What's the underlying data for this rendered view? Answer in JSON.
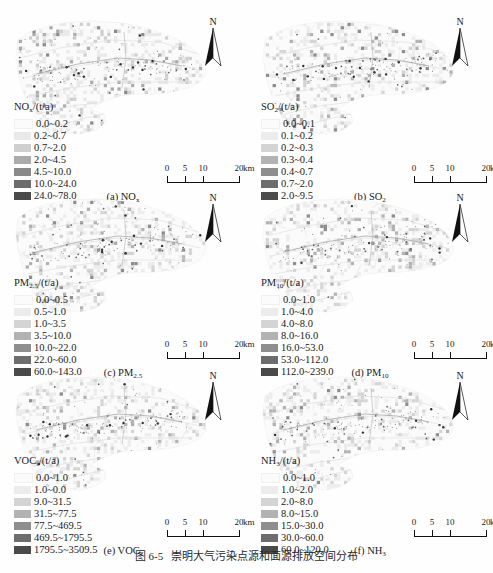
{
  "figure": {
    "caption_number": "图 6-5",
    "caption_text": "崇明大气污染点源和面源排放空间分布"
  },
  "common": {
    "north_label": "N",
    "scale": {
      "labels": [
        "0",
        "5",
        "10",
        "20"
      ],
      "unit": "km"
    }
  },
  "panels": [
    {
      "id": "a",
      "subcaption_prefix": "(a) NO",
      "subcaption_sub": "x",
      "legend_title_main": "NO",
      "legend_title_sub": "x",
      "legend_title_tail": "/(t/a)",
      "classes": [
        {
          "label": "0.0~0.2",
          "color": "#fbfbfb"
        },
        {
          "label": "0.2~0.7",
          "color": "#e9e9e9"
        },
        {
          "label": "0.7~2.0",
          "color": "#cfcfcf"
        },
        {
          "label": "2.0~4.5",
          "color": "#ababab"
        },
        {
          "label": "4.5~10.0",
          "color": "#8a8a8a"
        },
        {
          "label": "10.0~24.0",
          "color": "#6b6b6b"
        },
        {
          "label": "24.0~78.0",
          "color": "#4a4a4a"
        }
      ]
    },
    {
      "id": "b",
      "subcaption_prefix": "(b) SO",
      "subcaption_sub": "2",
      "legend_title_main": "SO",
      "legend_title_sub": "2",
      "legend_title_tail": "/(t/a)",
      "classes": [
        {
          "label": "0.0~0.1",
          "color": "#fbfbfb"
        },
        {
          "label": "0.1~0.2",
          "color": "#ececec"
        },
        {
          "label": "0.2~0.3",
          "color": "#d4d4d4"
        },
        {
          "label": "0.3~0.4",
          "color": "#b2b2b2"
        },
        {
          "label": "0.4~0.7",
          "color": "#8e8e8e"
        },
        {
          "label": "0.7~2.0",
          "color": "#6d6d6d"
        },
        {
          "label": "2.0~9.5",
          "color": "#4c4c4c"
        }
      ]
    },
    {
      "id": "c",
      "subcaption_prefix": "(c) PM",
      "subcaption_sub": "2.5",
      "legend_title_main": "PM",
      "legend_title_sub": "2.5",
      "legend_title_tail": "/(t/a)",
      "classes": [
        {
          "label": "0.0~0.5",
          "color": "#fbfbfb"
        },
        {
          "label": "0.5~1.0",
          "color": "#ececec"
        },
        {
          "label": "1.0~3.5",
          "color": "#d4d4d4"
        },
        {
          "label": "3.5~10.0",
          "color": "#b2b2b2"
        },
        {
          "label": "10.0~22.0",
          "color": "#8e8e8e"
        },
        {
          "label": "22.0~60.0",
          "color": "#6d6d6d"
        },
        {
          "label": "60.0~143.0",
          "color": "#4a4a4a"
        }
      ]
    },
    {
      "id": "d",
      "subcaption_prefix": "(d) PM",
      "subcaption_sub": "10",
      "legend_title_main": "PM",
      "legend_title_sub": "10",
      "legend_title_tail": "/(t/a)",
      "classes": [
        {
          "label": "0.0~1.0",
          "color": "#fbfbfb"
        },
        {
          "label": "1.0~4.0",
          "color": "#ececec"
        },
        {
          "label": "4.0~8.0",
          "color": "#d4d4d4"
        },
        {
          "label": "8.0~16.0",
          "color": "#b2b2b2"
        },
        {
          "label": "16.0~53.0",
          "color": "#8e8e8e"
        },
        {
          "label": "53.0~112.0",
          "color": "#6d6d6d"
        },
        {
          "label": "112.0~239.0",
          "color": "#4a4a4a"
        }
      ]
    },
    {
      "id": "e",
      "subcaption_prefix": "(e) VOC",
      "subcaption_sub": "s",
      "legend_title_main": "VOC",
      "legend_title_sub": "s",
      "legend_title_tail": "/(t/a)",
      "classes": [
        {
          "label": "0.0~1.0",
          "color": "#fbfbfb"
        },
        {
          "label": "1.0~0.0",
          "color": "#ececec"
        },
        {
          "label": "9.0~31.5",
          "color": "#d4d4d4"
        },
        {
          "label": "31.5~77.5",
          "color": "#b2b2b2"
        },
        {
          "label": "77.5~469.5",
          "color": "#8e8e8e"
        },
        {
          "label": "469.5~1795.5",
          "color": "#6d6d6d"
        },
        {
          "label": "1795.5~3509.5",
          "color": "#4a4a4a"
        }
      ]
    },
    {
      "id": "f",
      "subcaption_prefix": "(f) NH",
      "subcaption_sub": "3",
      "legend_title_main": "NH",
      "legend_title_sub": "3",
      "legend_title_tail": "/(t/a)",
      "classes": [
        {
          "label": "0.0~1.0",
          "color": "#fbfbfb"
        },
        {
          "label": "1.0~2.0",
          "color": "#ececec"
        },
        {
          "label": "2.0~8.0",
          "color": "#d4d4d4"
        },
        {
          "label": "8.0~15.0",
          "color": "#b2b2b2"
        },
        {
          "label": "15.0~30.0",
          "color": "#8e8e8e"
        },
        {
          "label": "30.0~60.0",
          "color": "#6d6d6d"
        },
        {
          "label": "60.0~120.0",
          "color": "#4a4a4a"
        }
      ]
    }
  ]
}
